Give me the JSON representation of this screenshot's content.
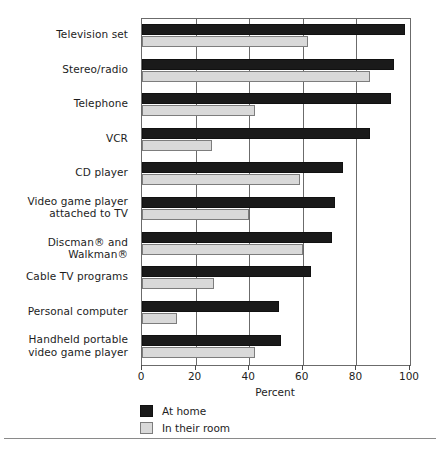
{
  "chart_data": {
    "type": "bar",
    "orientation": "horizontal",
    "title": "",
    "xlabel": "Percent",
    "ylabel": "",
    "xlim": [
      0,
      100
    ],
    "xticks": [
      0,
      20,
      40,
      60,
      80,
      100
    ],
    "xticklabels": [
      "0",
      "20",
      "40",
      "60",
      "80",
      "100"
    ],
    "grid": "vertical",
    "legend_position": "below-axis-left",
    "categories": [
      "Television set",
      "Stereo/radio",
      "Telephone",
      "VCR",
      "CD player",
      "Video game player attached to TV",
      "Discman® and Walkman®",
      "Cable TV programs",
      "Personal computer",
      "Handheld portable video game player"
    ],
    "category_lines": [
      [
        "Television set"
      ],
      [
        "Stereo/radio"
      ],
      [
        "Telephone"
      ],
      [
        "VCR"
      ],
      [
        "CD player"
      ],
      [
        "Video game player",
        "attached to TV"
      ],
      [
        "Discman® and Walkman®"
      ],
      [
        "Cable TV programs"
      ],
      [
        "Personal computer"
      ],
      [
        "Handheld portable",
        "video game player"
      ]
    ],
    "series": [
      {
        "name": "At home",
        "color": "#1a1a1a",
        "values": [
          98,
          94,
          93,
          85,
          75,
          72,
          71,
          63,
          51,
          52
        ]
      },
      {
        "name": "In their room",
        "color": "#d9d9d9",
        "values": [
          62,
          85,
          42,
          26,
          59,
          40,
          60,
          27,
          13,
          42
        ]
      }
    ]
  },
  "legend": {
    "items": [
      {
        "label": "At home",
        "swatch": "home"
      },
      {
        "label": "In their room",
        "swatch": "room"
      }
    ]
  },
  "axis": {
    "x_title": "Percent"
  },
  "colors": {
    "home_fill": "#1a1a1a",
    "room_fill": "#d9d9d9",
    "frame": "#6b6b6b",
    "text": "#1d1d1d"
  }
}
